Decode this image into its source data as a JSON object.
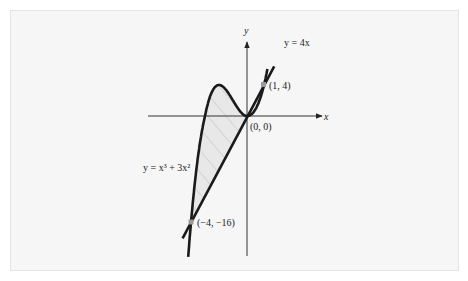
{
  "figure": {
    "background": "#f6f6f6",
    "curve_color": "#1a1a1a",
    "fill_color": "#e6e6e6",
    "hatch_color": "#b8b8b8",
    "point_color": "#9a9a9a"
  },
  "labels": {
    "x_axis": "x",
    "y_axis": "y",
    "line": "y = 4x",
    "cubic": "y = x³ + 3x²",
    "point_origin": "(0, 0)",
    "point_upper": "(1, 4)",
    "point_lower": "(−4, −16)"
  },
  "chart_data": {
    "type": "line",
    "title": "",
    "xlabel": "x",
    "ylabel": "y",
    "grid": false,
    "legend": "none",
    "series": [
      {
        "name": "y = x^3 + 3x^2",
        "function": "x^3 + 3x^2",
        "x_range": [
          -4.2,
          1.2
        ]
      },
      {
        "name": "y = 4x",
        "function": "4x",
        "x_range": [
          -4.6,
          1.6
        ]
      }
    ],
    "intersection_points": [
      {
        "x": -4,
        "y": -16,
        "label": "(-4, -16)"
      },
      {
        "x": 0,
        "y": 0,
        "label": "(0, 0)"
      },
      {
        "x": 1,
        "y": 4,
        "label": "(1, 4)"
      }
    ],
    "shaded_region": {
      "between": [
        "y = x^3 + 3x^2",
        "y = 4x"
      ],
      "x_from": -4,
      "x_to": 0,
      "style": "hatched"
    },
    "annotations": [
      "y = 4x",
      "y = x^3 + 3x^2",
      "(1, 4)",
      "(0, 0)",
      "(-4, -16)"
    ]
  }
}
